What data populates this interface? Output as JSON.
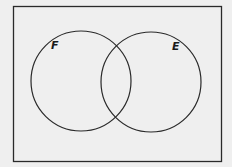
{
  "diagram": {
    "type": "venn",
    "sets": [
      {
        "label": "F",
        "position": "left"
      },
      {
        "label": "E",
        "position": "right"
      }
    ],
    "universal_set_label": "",
    "colors": {
      "background": "#efefef",
      "stroke": "#2a2a2a"
    }
  }
}
